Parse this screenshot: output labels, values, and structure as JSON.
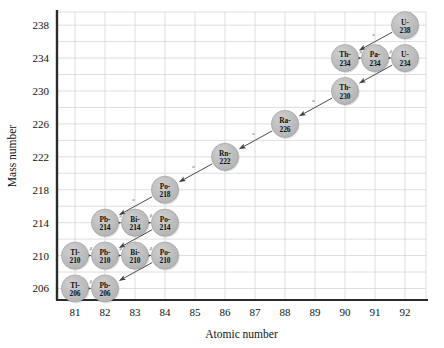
{
  "chart_data": {
    "type": "scatter",
    "title": "",
    "xlabel": "Atomic number",
    "ylabel": "Mass number",
    "xlim": [
      80.4,
      92.7
    ],
    "ylim": [
      204.6,
      239.6
    ],
    "xticks": [
      81,
      82,
      83,
      84,
      85,
      86,
      87,
      88,
      89,
      90,
      91,
      92
    ],
    "yticks": [
      206,
      210,
      214,
      218,
      222,
      226,
      230,
      234,
      238
    ],
    "x_gridline_step": 1,
    "y_gridline_step": 2,
    "grid": true,
    "legend": "none",
    "nodes": [
      {
        "id": "U-238",
        "sym": "U-",
        "mass": "238",
        "x": 92,
        "y": 238
      },
      {
        "id": "Th-234",
        "sym": "Th-",
        "mass": "234",
        "x": 90,
        "y": 234
      },
      {
        "id": "Pa-234",
        "sym": "Pa-",
        "mass": "234",
        "x": 91,
        "y": 234
      },
      {
        "id": "U-234",
        "sym": "U-",
        "mass": "234",
        "x": 92,
        "y": 234
      },
      {
        "id": "Th-230",
        "sym": "Th-",
        "mass": "230",
        "x": 90,
        "y": 230
      },
      {
        "id": "Ra-226",
        "sym": "Ra-",
        "mass": "226",
        "x": 88,
        "y": 226
      },
      {
        "id": "Rn-222",
        "sym": "Rn-",
        "mass": "222",
        "x": 86,
        "y": 222
      },
      {
        "id": "Po-218",
        "sym": "Po-",
        "mass": "218",
        "x": 84,
        "y": 218
      },
      {
        "id": "Pb-214",
        "sym": "Pb-",
        "mass": "214",
        "x": 82,
        "y": 214
      },
      {
        "id": "Bi-214",
        "sym": "Bi-",
        "mass": "214",
        "x": 83,
        "y": 214
      },
      {
        "id": "Po-214",
        "sym": "Po-",
        "mass": "214",
        "x": 84,
        "y": 214
      },
      {
        "id": "Tl-210",
        "sym": "Tl-",
        "mass": "210",
        "x": 81,
        "y": 210
      },
      {
        "id": "Pb-210",
        "sym": "Pb-",
        "mass": "210",
        "x": 82,
        "y": 210
      },
      {
        "id": "Bi-210",
        "sym": "Bi-",
        "mass": "210",
        "x": 83,
        "y": 210
      },
      {
        "id": "Po-210",
        "sym": "Po-",
        "mass": "210",
        "x": 84,
        "y": 210
      },
      {
        "id": "Tl-206",
        "sym": "Tl-",
        "mass": "206",
        "x": 81,
        "y": 206
      },
      {
        "id": "Pb-206",
        "sym": "Pb-",
        "mass": "206",
        "x": 82,
        "y": 206
      }
    ],
    "arrows": [
      {
        "from": "U-238",
        "to": "Th-234",
        "label": "α",
        "kind": "alpha"
      },
      {
        "from": "Pa-234",
        "to": "Th-234",
        "label": "β",
        "kind": "beta"
      },
      {
        "from": "U-234",
        "to": "Pa-234",
        "label": "β",
        "kind": "beta"
      },
      {
        "from": "U-234",
        "to": "Th-230",
        "label": "α",
        "kind": "alpha"
      },
      {
        "from": "Th-230",
        "to": "Ra-226",
        "label": "α",
        "kind": "alpha"
      },
      {
        "from": "Ra-226",
        "to": "Rn-222",
        "label": "α",
        "kind": "alpha"
      },
      {
        "from": "Rn-222",
        "to": "Po-218",
        "label": "α",
        "kind": "alpha"
      },
      {
        "from": "Po-218",
        "to": "Pb-214",
        "label": "α",
        "kind": "alpha"
      },
      {
        "from": "Bi-214",
        "to": "Pb-214",
        "label": "β",
        "kind": "beta"
      },
      {
        "from": "Po-214",
        "to": "Bi-214",
        "label": "β",
        "kind": "beta"
      },
      {
        "from": "Po-214",
        "to": "Pb-210",
        "label": "α",
        "kind": "alpha"
      },
      {
        "from": "Pb-210",
        "to": "Tl-210",
        "label": "β",
        "kind": "beta"
      },
      {
        "from": "Bi-210",
        "to": "Pb-210",
        "label": "β",
        "kind": "beta"
      },
      {
        "from": "Po-210",
        "to": "Bi-210",
        "label": "β",
        "kind": "beta"
      },
      {
        "from": "Po-210",
        "to": "Pb-206",
        "label": "α",
        "kind": "alpha"
      },
      {
        "from": "Pb-206",
        "to": "Tl-206",
        "label": "β",
        "kind": "beta"
      }
    ],
    "colors": {
      "node_fill": "#b9b9b9",
      "node_stroke": "#9a9a9a",
      "grid": "#d6d6d6",
      "axis": "#2b2b2b",
      "arrow": "#4a4a57",
      "text": "#111111",
      "background": "#ffffff"
    }
  }
}
